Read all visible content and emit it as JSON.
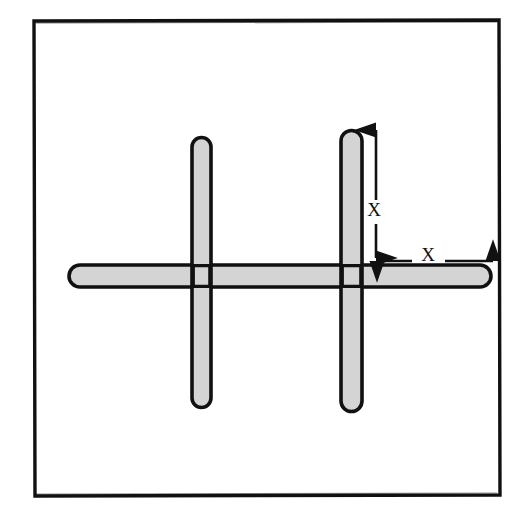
{
  "figure": {
    "kind": "hand-drawn-line-diagram",
    "background_color": "#FFFFFF",
    "frame": {
      "name": "outer-border",
      "stroke_color": "#111111",
      "fill_color": "#FFFFFF",
      "left": 33,
      "top": 19,
      "right": 500,
      "bottom": 496
    },
    "bar_style": {
      "fill_color": "#D4D4D4",
      "stroke_color": "#111111",
      "stroke_width": 3.5,
      "cap": "round"
    },
    "bars": [
      {
        "name": "vertical-bar-left",
        "orientation": "vertical",
        "x_center": 201,
        "y_start": 138,
        "y_end": 407,
        "thickness": 19,
        "length": 269
      },
      {
        "name": "vertical-bar-right",
        "orientation": "vertical",
        "x_center": 351,
        "y_start": 130,
        "y_end": 411,
        "thickness": 21,
        "length": 281
      },
      {
        "name": "horizontal-bar",
        "orientation": "horizontal",
        "y_center": 276,
        "x_start": 80,
        "x_end": 480,
        "thickness": 22,
        "length": 400
      }
    ],
    "dimensions": [
      {
        "name": "vertical-dimension",
        "label": "X",
        "orientation": "vertical",
        "x": 376,
        "y_start": 129,
        "y_end": 258,
        "label_x": 373,
        "label_y": 212,
        "arrowheads": "both",
        "measures": "top of right vertical bar down to top of horizontal bar"
      },
      {
        "name": "horizontal-dimension",
        "label": "X",
        "orientation": "horizontal",
        "y": 261,
        "x_start": 377,
        "x_end": 493,
        "label_x": 428,
        "label_y": 254,
        "arrowheads": "both",
        "measures": "right edge of right vertical bar out to right end of horizontal bar"
      }
    ],
    "annotation_style": {
      "stroke_color": "#111111",
      "line_width": 2.6,
      "label_color": "#111111",
      "label_font_size_px": 19
    }
  }
}
